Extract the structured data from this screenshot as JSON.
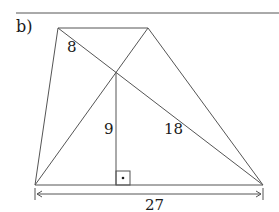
{
  "label": "b)",
  "figure": {
    "type": "trapezoid with diagonals and height",
    "segment_labels": {
      "diagonal_upper_part": "8",
      "height": "9",
      "diagonal_lower_part": "18",
      "base": "27"
    },
    "colors": {
      "line": "#555555",
      "text": "#1a1a1a",
      "background": "#ffffff"
    }
  }
}
